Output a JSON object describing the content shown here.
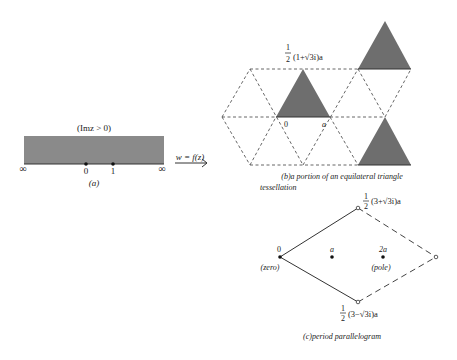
{
  "panel_a": {
    "region_label": "(Imz > 0)",
    "left_infinity": "∞",
    "right_infinity": "∞",
    "point_0": "0",
    "point_1": "1",
    "caption": "(a)",
    "map_label": "w = f(z)",
    "fill_color": "#8a8a8a"
  },
  "panel_b": {
    "vertex_label": "1/2(1+√3i)a",
    "vertex_label_num": "1",
    "vertex_label_den": "2",
    "vertex_label_rest": "(1+√3i)a",
    "origin_label": "0",
    "a_label": "a",
    "caption_line1": "(b)a  portion  of  an  equilateral  triangle",
    "caption_line2": "tessellation",
    "fill_color": "#6e6e6e"
  },
  "panel_c": {
    "top_vertex_num": "1",
    "top_vertex_den": "2",
    "top_vertex_rest": "(3+√3i)a",
    "bottom_vertex_num": "1",
    "bottom_vertex_den": "2",
    "bottom_vertex_rest": "(3−√3i)a",
    "zero_label": "0",
    "zero_note": "(zero)",
    "a_label": "a",
    "two_a_label": "2a",
    "pole_note": "(pole)",
    "caption": "(c)period   parallelogram"
  }
}
